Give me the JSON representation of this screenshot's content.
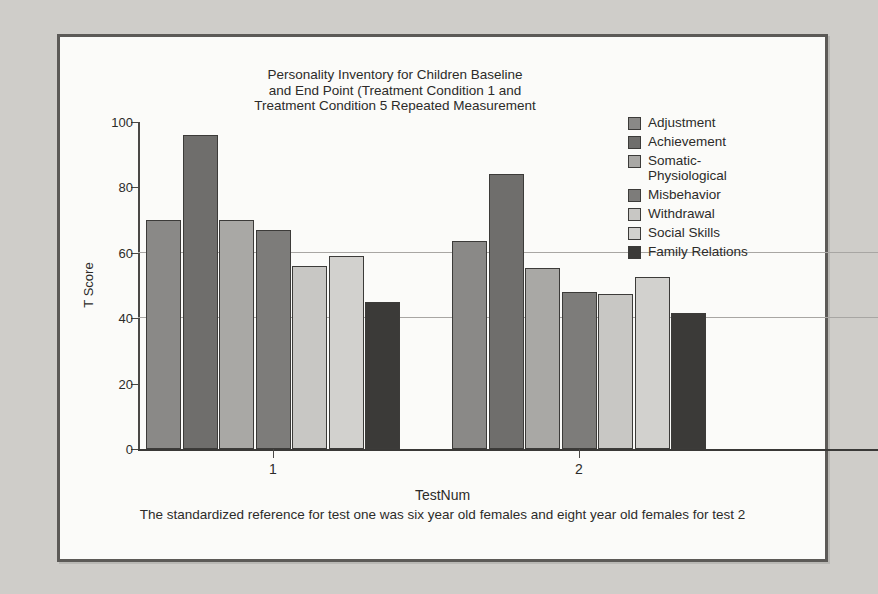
{
  "chart_data": {
    "type": "bar",
    "title": "Personality Inventory for Children Baseline\nand End Point  (Treatment Condition 1 and\nTreatment Condition 5 Repeated Measurement",
    "xlabel": "TestNum",
    "ylabel": "T Score",
    "footnote": "The standardized reference for test one was six year old females and eight year old females for test 2",
    "categories": [
      "1",
      "2"
    ],
    "ylim": [
      0,
      100
    ],
    "yticks": [
      0,
      20,
      40,
      60,
      80,
      100
    ],
    "ytick_labels": [
      "0",
      "20",
      "40",
      "60",
      "80",
      "100"
    ],
    "gridlines": [
      40,
      60
    ],
    "grid": true,
    "legend_position": "right",
    "series": [
      {
        "name": "Adjustment",
        "color": "#8a8987",
        "values": [
          70.0,
          63.5
        ]
      },
      {
        "name": "Achievement",
        "color": "#6f6e6c",
        "values": [
          96.0,
          84.0
        ]
      },
      {
        "name": "Somatic-\nPhysiological",
        "color": "#a9a8a5",
        "values": [
          70.0,
          55.5
        ]
      },
      {
        "name": "Misbehavior",
        "color": "#7d7c7a",
        "values": [
          67.0,
          48.0
        ]
      },
      {
        "name": "Withdrawal",
        "color": "#c8c7c4",
        "values": [
          56.0,
          47.5
        ]
      },
      {
        "name": "Social Skills",
        "color": "#d2d1ce",
        "values": [
          59.0,
          52.5
        ]
      },
      {
        "name": "Family Relations",
        "color": "#3b3a38",
        "values": [
          45.0,
          41.5
        ]
      }
    ]
  },
  "page": {
    "background_color": "#cfcdc9",
    "frame_color": "#5c5a57",
    "plot_background": "#fbfbf9"
  }
}
